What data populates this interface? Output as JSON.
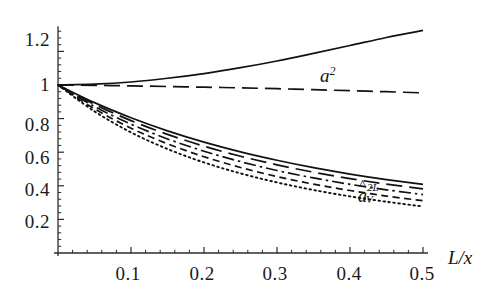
{
  "chart_data": {
    "type": "line",
    "title": "",
    "xlabel": "L/x",
    "ylabel": "",
    "xlim": [
      0,
      0.5
    ],
    "ylim": [
      0,
      1.35
    ],
    "grid": false,
    "legend_position": "inline-annotations",
    "x_ticks": [
      "0.1",
      "0.2",
      "0.3",
      "0.4",
      "0.5"
    ],
    "x_tick_values": [
      0.1,
      0.2,
      0.3,
      0.4,
      0.5
    ],
    "y_ticks": [
      "0.2",
      "0.4",
      "0.6",
      "0.8",
      "1",
      "1.2"
    ],
    "y_tick_values": [
      0.2,
      0.4,
      0.6,
      0.8,
      1.0,
      1.2
    ],
    "minor_ticks_per_interval": 5,
    "annotations": [
      {
        "name": "a-squared-label",
        "text_base": "a",
        "text_sup": "2",
        "x": 0.365,
        "y": 1.12
      },
      {
        "name": "a-hat-v-2L-label",
        "text_base": "a",
        "text_sup": "2L",
        "text_sub": "V",
        "x": 0.425,
        "y": 0.47
      }
    ],
    "x": [
      0,
      0.05,
      0.1,
      0.15,
      0.2,
      0.25,
      0.3,
      0.35,
      0.4,
      0.45,
      0.5
    ],
    "series": [
      {
        "name": "a^2",
        "style": "solid",
        "values": [
          1.0,
          1.005,
          1.018,
          1.04,
          1.068,
          1.103,
          1.143,
          1.188,
          1.235,
          1.283,
          1.325
        ]
      },
      {
        "name": "a^2 long-dashed companion",
        "style": "longdash",
        "values": [
          1.0,
          0.998,
          0.995,
          0.991,
          0.987,
          0.983,
          0.978,
          0.972,
          0.966,
          0.96,
          0.953
        ]
      },
      {
        "name": "aV2L solid",
        "style": "solid",
        "values": [
          1.0,
          0.895,
          0.805,
          0.727,
          0.66,
          0.602,
          0.552,
          0.508,
          0.47,
          0.437,
          0.408
        ]
      },
      {
        "name": "aV2L long-dashed",
        "style": "longdash",
        "values": [
          1.0,
          0.885,
          0.788,
          0.706,
          0.636,
          0.576,
          0.525,
          0.481,
          0.443,
          0.41,
          0.382
        ]
      },
      {
        "name": "aV2L dash-dot",
        "style": "dashdot",
        "values": [
          1.0,
          0.872,
          0.767,
          0.679,
          0.606,
          0.544,
          0.491,
          0.447,
          0.409,
          0.376,
          0.348
        ]
      },
      {
        "name": "aV2L dashed",
        "style": "dash",
        "values": [
          1.0,
          0.858,
          0.743,
          0.65,
          0.573,
          0.509,
          0.455,
          0.41,
          0.372,
          0.339,
          0.311
        ]
      },
      {
        "name": "aV2L dotted",
        "style": "dotted",
        "values": [
          1.0,
          0.843,
          0.718,
          0.619,
          0.539,
          0.474,
          0.42,
          0.375,
          0.337,
          0.305,
          0.277
        ]
      }
    ]
  },
  "axis": {
    "x_label_text": "L/x",
    "x_tick_labels": [
      "0.1",
      "0.2",
      "0.3",
      "0.4",
      "0.5"
    ],
    "y_tick_labels": [
      "1.2",
      "1",
      "0.8",
      "0.6",
      "0.4",
      "0.2"
    ]
  },
  "labels": {
    "a_squared": "a",
    "a_squared_exp": "2",
    "a_hat_base": "a",
    "a_hat_exp": "2L",
    "a_hat_sub": "V",
    "hat_glyph": "^"
  }
}
